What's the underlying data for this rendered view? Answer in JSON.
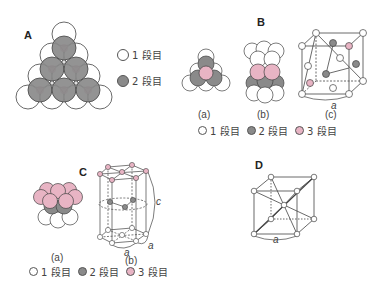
{
  "colors": {
    "layer1": "#ffffff",
    "layer2": "#8a8a8a",
    "layer3": "#e8b4c4",
    "line": "#444444"
  },
  "panels": {
    "A": {
      "label": "A",
      "legend": [
        {
          "color_key": "layer1",
          "text": "1 段目"
        },
        {
          "color_key": "layer2",
          "text": "2 段目"
        }
      ]
    },
    "B": {
      "label": "B",
      "sub_labels": [
        "(a)",
        "(b)",
        "(c)"
      ],
      "lattice_label": "a",
      "legend": [
        {
          "color_key": "layer1",
          "text": "1 段目"
        },
        {
          "color_key": "layer2",
          "text": "2 段目"
        },
        {
          "color_key": "layer3",
          "text": "3 段目"
        }
      ]
    },
    "C": {
      "label": "C",
      "sub_labels": [
        "(a)",
        "(b)"
      ],
      "lattice_labels": [
        "a",
        "a",
        "c"
      ],
      "legend": [
        {
          "color_key": "layer1",
          "text": "1 段目"
        },
        {
          "color_key": "layer2",
          "text": "2 段目"
        },
        {
          "color_key": "layer3",
          "text": "3 段目"
        }
      ]
    },
    "D": {
      "label": "D",
      "lattice_label": "a"
    }
  }
}
